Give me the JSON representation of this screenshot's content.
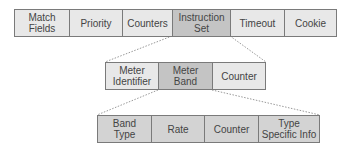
{
  "colors": {
    "cell_light": "#e8e8e8",
    "cell_highlight": "#c4c4c4",
    "cell_bottom": "#d3d3d3",
    "border": "#7a7a7a",
    "connector": "#999999"
  },
  "flow_entry": {
    "fields": [
      {
        "label": "Match\nFields"
      },
      {
        "label": "Priority"
      },
      {
        "label": "Counters"
      },
      {
        "label": "Instruction\nSet"
      },
      {
        "label": "Timeout"
      },
      {
        "label": "Cookie"
      }
    ]
  },
  "meter_entry": {
    "fields": [
      {
        "label": "Meter\nIdentifier"
      },
      {
        "label": "Meter\nBand"
      },
      {
        "label": "Counter"
      }
    ]
  },
  "meter_band": {
    "fields": [
      {
        "label": "Band\nType"
      },
      {
        "label": "Rate"
      },
      {
        "label": "Counter"
      },
      {
        "label": "Type\nSpecific Info"
      }
    ]
  }
}
